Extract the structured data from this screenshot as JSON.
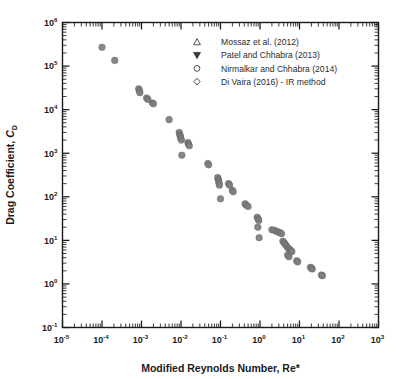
{
  "chart_data": {
    "type": "scatter",
    "title": "",
    "xlabel": "Modified Reynolds Number, Re*",
    "ylabel": "Drag Coefficient, C_D",
    "ylabel_main": "Drag Coefficient, ",
    "ylabel_symbol": "C",
    "ylabel_subscript": "D",
    "xscale": "log",
    "yscale": "log",
    "xlim": [
      1e-05,
      1000
    ],
    "ylim": [
      0.1,
      1000000
    ],
    "grid": false,
    "legend_position": "upper-right-inside",
    "xtick_labels": [
      "10-5",
      "10-4",
      "10-3",
      "10-2",
      "10-1",
      "100",
      "101",
      "102",
      "103"
    ],
    "xtick_mantissa": [
      "10",
      "10",
      "10",
      "10",
      "10",
      "10",
      "10",
      "10",
      "10"
    ],
    "xtick_exponents": [
      "-5",
      "-4",
      "-3",
      "-2",
      "-1",
      "0",
      "1",
      "2",
      "3"
    ],
    "xtick_values": [
      1e-05,
      0.0001,
      0.001,
      0.01,
      0.1,
      1,
      10,
      100,
      1000
    ],
    "ytick_mantissa": [
      "10",
      "10",
      "10",
      "10",
      "10",
      "10",
      "10",
      "10"
    ],
    "ytick_exponents": [
      "-1",
      "0",
      "1",
      "2",
      "3",
      "4",
      "5",
      "6"
    ],
    "ytick_values": [
      0.1,
      1,
      10,
      100,
      1000,
      10000,
      100000,
      1000000
    ],
    "marker_color": "#7d7d7d",
    "marker_edge_color": "#5d5d5d",
    "marker_size_px": 4.4,
    "series": [
      {
        "name": "Mossaz et al. (2012)",
        "marker": "triangle-up-open",
        "points": []
      },
      {
        "name": "Patel and Chhabra (2013)",
        "marker": "triangle-down-filled",
        "points": []
      },
      {
        "name": "Nirmalkar and Chhabra (2014)",
        "marker": "circle-open",
        "points": []
      },
      {
        "name": "Di Vaira (2016) - IR method",
        "marker": "diamond-open",
        "points": []
      }
    ],
    "points": [
      [
        0.0001,
        270000.0
      ],
      [
        0.00021,
        135000.0
      ],
      [
        0.00085,
        30000.0
      ],
      [
        0.00088,
        27500.0
      ],
      [
        0.00091,
        24500.0
      ],
      [
        0.00135,
        18500.0
      ],
      [
        0.00145,
        17200.0
      ],
      [
        0.0019,
        14200.0
      ],
      [
        0.002,
        13600.0
      ],
      [
        0.005,
        5900.0
      ],
      [
        0.009,
        3000.0
      ],
      [
        0.0093,
        2700.0
      ],
      [
        0.0096,
        2450.0
      ],
      [
        0.0099,
        2200.0
      ],
      [
        0.0102,
        2000.0
      ],
      [
        0.015,
        1750.0
      ],
      [
        0.0155,
        1600.0
      ],
      [
        0.0162,
        1480.0
      ],
      [
        0.0105,
        900.0
      ],
      [
        0.048,
        580.0
      ],
      [
        0.05,
        540.0
      ],
      [
        0.085,
        275.0
      ],
      [
        0.088,
        250.0
      ],
      [
        0.09,
        230.0
      ],
      [
        0.092,
        205.0
      ],
      [
        0.094,
        185.0
      ],
      [
        0.16,
        200.0
      ],
      [
        0.17,
        185.0
      ],
      [
        0.2,
        140.0
      ],
      [
        0.21,
        130.0
      ],
      [
        0.1,
        90.0
      ],
      [
        0.42,
        69.0
      ],
      [
        0.45,
        64.0
      ],
      [
        0.5,
        60.0
      ],
      [
        0.85,
        34.0
      ],
      [
        0.9,
        31.0
      ],
      [
        0.93,
        28.5
      ],
      [
        0.88,
        20.0
      ],
      [
        0.95,
        11.5
      ],
      [
        2.0,
        17.5
      ],
      [
        2.3,
        17.0
      ],
      [
        2.6,
        16.2
      ],
      [
        2.9,
        15.5
      ],
      [
        3.2,
        15.0
      ],
      [
        3.5,
        14.2
      ],
      [
        3.8,
        9.5
      ],
      [
        4.1,
        8.8
      ],
      [
        4.4,
        8.0
      ],
      [
        4.8,
        7.2
      ],
      [
        5.2,
        6.6
      ],
      [
        5.6,
        6.2
      ],
      [
        6.0,
        5.8
      ],
      [
        6.4,
        5.5
      ],
      [
        5.0,
        4.6
      ],
      [
        5.4,
        4.2
      ],
      [
        8.5,
        3.4
      ],
      [
        9.0,
        3.2
      ],
      [
        19.0,
        2.4
      ],
      [
        20.0,
        2.3
      ],
      [
        21.0,
        2.2
      ],
      [
        36.0,
        1.6
      ],
      [
        38.0,
        1.55
      ]
    ]
  },
  "legend": {
    "entries": [
      {
        "label": "Mossaz et al. (2012)",
        "marker": "triangle-up-open"
      },
      {
        "label": "Patel and Chhabra (2013)",
        "marker": "triangle-down-filled"
      },
      {
        "label": "Nirmalkar and Chhabra (2014)",
        "marker": "circle-open"
      },
      {
        "label": "Di Vaira (2016) - IR method",
        "marker": "diamond-open"
      }
    ]
  }
}
